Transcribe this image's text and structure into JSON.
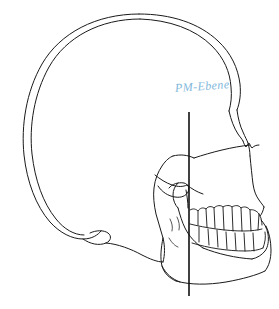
{
  "figure": {
    "background_color": "#ffffff",
    "width": 279,
    "height": 309
  },
  "annotations": [
    {
      "id": "pm-plane-label",
      "text": "PM-Ebene",
      "color": "#7fb8dc",
      "x": 175,
      "y": 81,
      "rotation_deg": -4,
      "style": "handwritten"
    }
  ],
  "reference_lines": [
    {
      "id": "pm-plane-line",
      "label": "PM-Ebene",
      "color": "#111111",
      "orientation": "vertical",
      "x": 189,
      "y_top": 112,
      "y_bottom": 296
    }
  ],
  "drawing": {
    "line_color": "#1a1a1a",
    "structures": [
      {
        "name": "cranial-vault-outer-table",
        "type": "curve"
      },
      {
        "name": "cranial-vault-inner-table",
        "type": "curve"
      },
      {
        "name": "occipital-bone",
        "type": "curve"
      },
      {
        "name": "mastoid-process",
        "type": "curve"
      },
      {
        "name": "cranial-base",
        "type": "curve"
      },
      {
        "name": "frontal-bone",
        "type": "curve"
      },
      {
        "name": "nasal-bone",
        "type": "curve"
      },
      {
        "name": "nasal-aperture",
        "type": "curve"
      },
      {
        "name": "orbit",
        "type": "curve"
      },
      {
        "name": "zygomatic-arch",
        "type": "curve"
      },
      {
        "name": "maxilla",
        "type": "curve"
      },
      {
        "name": "hard-palate",
        "type": "line"
      },
      {
        "name": "mandible-ramus",
        "type": "curve"
      },
      {
        "name": "mandible-body",
        "type": "curve"
      },
      {
        "name": "mental-symphysis",
        "type": "curve"
      },
      {
        "name": "condyle",
        "type": "curve"
      },
      {
        "name": "coronoid-process",
        "type": "curve"
      },
      {
        "name": "maxillary-teeth",
        "type": "teeth-row"
      },
      {
        "name": "mandibular-teeth",
        "type": "teeth-row"
      }
    ]
  }
}
